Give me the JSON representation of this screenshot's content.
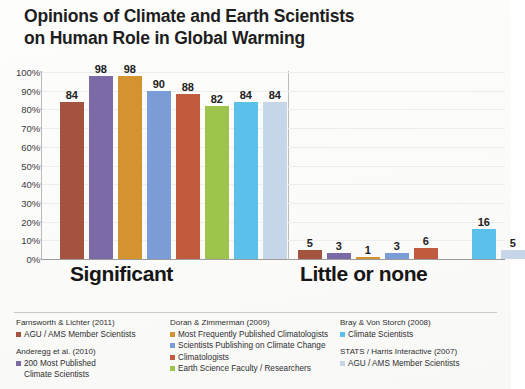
{
  "title": {
    "line1": "Opinions of Climate and Earth Scientists",
    "line2": "on Human Role in Global Warming"
  },
  "chart_data": {
    "type": "bar",
    "title": "Opinions of Climate and Earth Scientists on Human Role in Global Warming",
    "xlabel": "",
    "ylabel": "",
    "ylim": [
      0,
      100
    ],
    "ytick_labels": [
      "100%",
      "90%",
      "80%",
      "70%",
      "60%",
      "50%",
      "40%",
      "30%",
      "20%",
      "10%",
      "0%"
    ],
    "ytick_values": [
      100,
      90,
      80,
      70,
      60,
      50,
      40,
      30,
      20,
      10,
      0
    ],
    "grid": true,
    "legend_position": "bottom",
    "categories": [
      "Significant",
      "Little or none"
    ],
    "series": [
      {
        "name": "AGU / AMS Member Scientists",
        "study": "Farnsworth & Lichter (2011)",
        "color": "#a4533f",
        "values": [
          84,
          5
        ]
      },
      {
        "name": "200 Most Published Climate Scientists",
        "study": "Anderegg et al. (2010)",
        "color": "#7b6aa6",
        "values": [
          98,
          3
        ]
      },
      {
        "name": "Most Frequently Published Climatologists",
        "study": "Doran & Zimmerman (2009)",
        "color": "#d5932f",
        "values": [
          98,
          1
        ]
      },
      {
        "name": "Scientists Publishing on Climate Change",
        "study": "Doran & Zimmerman (2009)",
        "color": "#7b9cd6",
        "values": [
          90,
          3
        ]
      },
      {
        "name": "Climatologists",
        "study": "Doran & Zimmerman (2009)",
        "color": "#c15b3f",
        "values": [
          88,
          6
        ]
      },
      {
        "name": "Earth Science Faculty / Researchers",
        "study": "Doran & Zimmerman (2009)",
        "color": "#9ec44e",
        "values": [
          82,
          null
        ]
      },
      {
        "name": "Climate Scientists",
        "study": "Bray & Von Storch (2008)",
        "color": "#5cc1ea",
        "values": [
          84,
          16
        ]
      },
      {
        "name": "AGU / AMS Member Scientists",
        "study": "STATS / Harris Interactive (2007)",
        "color": "#c7d5e9",
        "values": [
          84,
          5
        ]
      }
    ],
    "bar_labels": {
      "significant": [
        "84",
        "98",
        "98",
        "90",
        "88",
        "82",
        "84",
        "84"
      ],
      "little_or_none": [
        "5",
        "3",
        "1",
        "3",
        "6",
        "",
        "16",
        "5"
      ]
    }
  },
  "axis": {
    "ticks": [
      {
        "label": "100%",
        "value": 100
      },
      {
        "label": "90%",
        "value": 90
      },
      {
        "label": "80%",
        "value": 80
      },
      {
        "label": "70%",
        "value": 70
      },
      {
        "label": "60%",
        "value": 60
      },
      {
        "label": "50%",
        "value": 50
      },
      {
        "label": "40%",
        "value": 40
      },
      {
        "label": "30%",
        "value": 30
      },
      {
        "label": "20%",
        "value": 20
      },
      {
        "label": "10%",
        "value": 10
      },
      {
        "label": "0%",
        "value": 0
      }
    ]
  },
  "categories": [
    {
      "label": "Significant"
    },
    {
      "label": "Little or none"
    }
  ],
  "legend": {
    "columns": [
      {
        "groups": [
          {
            "study": "Farnsworth & Lichter (2011)",
            "items": [
              {
                "label": "AGU / AMS Member Scientists",
                "label2": "",
                "color": "#a4533f"
              }
            ]
          },
          {
            "study": "Anderegg et al. (2010)",
            "items": [
              {
                "label": "200 Most Published",
                "label2": "Climate Scientists",
                "color": "#7b6aa6"
              }
            ]
          }
        ]
      },
      {
        "groups": [
          {
            "study": "Doran & Zimmerman  (2009)",
            "items": [
              {
                "label": "Most Frequently Published Climatologists",
                "label2": "",
                "color": "#d5932f"
              },
              {
                "label": "Scientists Publishing on Climate Change",
                "label2": "",
                "color": "#7b9cd6"
              },
              {
                "label": "Climatologists",
                "label2": "",
                "color": "#c15b3f"
              },
              {
                "label": "Earth Science Faculty / Researchers",
                "label2": "",
                "color": "#9ec44e"
              }
            ]
          }
        ]
      },
      {
        "groups": [
          {
            "study": "Bray & Von Storch (2008)",
            "items": [
              {
                "label": "Climate Scientists",
                "label2": "",
                "color": "#5cc1ea"
              }
            ]
          },
          {
            "study": "STATS / Harris Interactive (2007)",
            "items": [
              {
                "label": "AGU / AMS Member Scientists",
                "label2": "",
                "color": "#c7d5e9"
              }
            ]
          }
        ]
      }
    ]
  }
}
